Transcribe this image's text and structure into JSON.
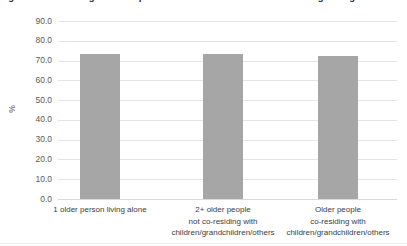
{
  "figure": {
    "caption": "Figure 3.1: Percentage of older persons who are satisfied with their living arrangement"
  },
  "chart_data": {
    "type": "bar",
    "title": "",
    "xlabel": "",
    "ylabel": "%",
    "ylim": [
      0,
      90
    ],
    "ytick_step": 10,
    "grid": true,
    "legend": "none",
    "bar_color": "#a6a6a6",
    "categories": [
      "1 older person living alone",
      "2+ older people\nnot co-residing with\nchildren/grandchildren/others",
      "Older people\nco-residing with\nchildren/grandchildren/others"
    ],
    "category_lines": [
      [
        "1 older person living alone"
      ],
      [
        "2+ older people",
        "not co-residing with",
        "children/grandchildren/others"
      ],
      [
        "Older people",
        "co-residing with",
        "children/grandchildren/others"
      ]
    ],
    "values": [
      73.2,
      73.2,
      72.2
    ],
    "ytick_labels": [
      "90.0",
      "80.0",
      "70.0",
      "60.0",
      "50.0",
      "40.0",
      "30.0",
      "20.0",
      "10.0",
      "0.0"
    ],
    "ytick_values": [
      90,
      80,
      70,
      60,
      50,
      40,
      30,
      20,
      10,
      0
    ]
  }
}
